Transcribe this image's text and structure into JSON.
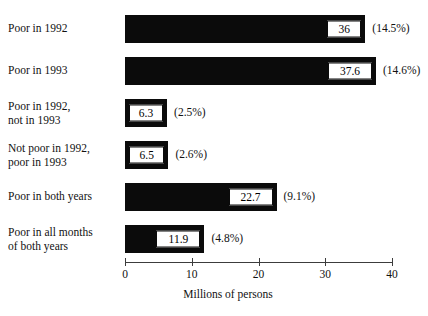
{
  "chart_data": {
    "type": "bar",
    "orientation": "horizontal",
    "title": "",
    "xlabel": "Millions of persons",
    "ylabel": "",
    "xlim": [
      0,
      40
    ],
    "xticks": [
      0,
      10,
      20,
      30,
      40
    ],
    "xtick_labels": [
      "0",
      "10",
      "20",
      "30",
      "40"
    ],
    "grid": false,
    "legend": null,
    "bar_color": "#0b0b0b",
    "background": "#ffffff",
    "categories": [
      "Poor in 1992",
      "Poor in 1993",
      "Poor in 1992,\nnot in 1993",
      "Not poor in 1992,\npoor in 1993",
      "Poor in both years",
      "Poor in all months\nof both years"
    ],
    "values": [
      36,
      37.6,
      6.3,
      6.5,
      22.7,
      11.9
    ],
    "value_labels": [
      "36",
      "37.6",
      "6.3",
      "6.5",
      "22.7",
      "11.9"
    ],
    "percent_labels": [
      "(14.5%)",
      "(14.6%)",
      "(2.5%)",
      "(2.6%)",
      "(9.1%)",
      "(4.8%)"
    ],
    "percent_values": [
      14.5,
      14.6,
      2.5,
      2.6,
      9.1,
      4.8
    ]
  },
  "rows": [
    {
      "label": "Poor in 1992",
      "value": 36,
      "value_label": "36",
      "percent_label": "(14.5%)"
    },
    {
      "label": "Poor in 1993",
      "value": 37.6,
      "value_label": "37.6",
      "percent_label": "(14.6%)"
    },
    {
      "label": "Poor in 1992,\nnot in 1993",
      "value": 6.3,
      "value_label": "6.3",
      "percent_label": "(2.5%)"
    },
    {
      "label": "Not poor in 1992,\npoor in 1993",
      "value": 6.5,
      "value_label": "6.5",
      "percent_label": "(2.6%)"
    },
    {
      "label": "Poor in both years",
      "value": 22.7,
      "value_label": "22.7",
      "percent_label": "(9.1%)"
    },
    {
      "label": "Poor in all months\nof both years",
      "value": 11.9,
      "value_label": "11.9",
      "percent_label": "(4.8%)"
    }
  ],
  "axis": {
    "title": "Millions of persons",
    "ticks": [
      {
        "value": 0,
        "label": "0"
      },
      {
        "value": 10,
        "label": "10"
      },
      {
        "value": 20,
        "label": "20"
      },
      {
        "value": 30,
        "label": "30"
      },
      {
        "value": 40,
        "label": "40"
      }
    ]
  }
}
